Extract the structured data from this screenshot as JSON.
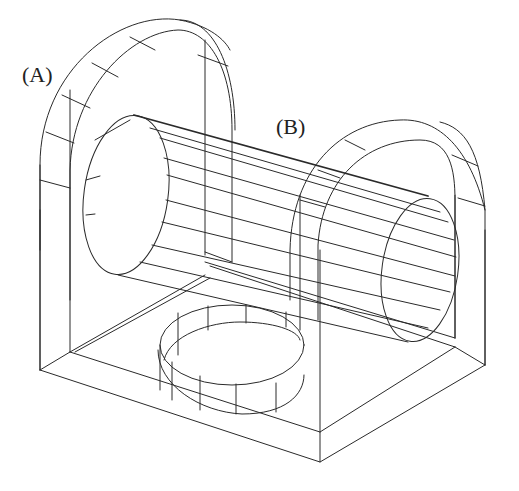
{
  "diagram": {
    "type": "isometric wireframe drawing",
    "labels": {
      "a": "(A)",
      "b": "(B)"
    },
    "parts": [
      {
        "id": "A",
        "name": "left arched upright"
      },
      {
        "id": "B",
        "name": "horizontal cylinder"
      },
      {
        "id": "right-upright",
        "name": "right arched upright"
      },
      {
        "id": "base",
        "name": "rectangular base block"
      },
      {
        "id": "recess",
        "name": "circular recess in base"
      }
    ],
    "line_color": "#2a2a2a",
    "background": "#ffffff"
  }
}
